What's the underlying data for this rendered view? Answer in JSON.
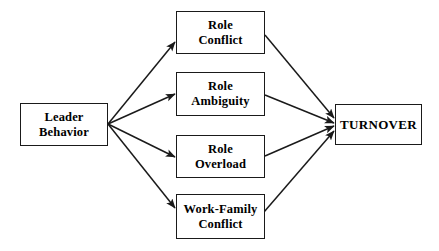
{
  "diagram": {
    "background_color": "#ffffff",
    "line_color": "#1a1a1a",
    "text_color": "#000000",
    "nodes": [
      {
        "id": "leader-behavior",
        "label": "Leader\nBehavior",
        "role": "predictor",
        "x": 20,
        "y": 103,
        "w": 88,
        "h": 43
      },
      {
        "id": "role-conflict",
        "label": "Role\nConflict",
        "role": "mediator",
        "x": 176,
        "y": 11,
        "w": 89,
        "h": 43
      },
      {
        "id": "role-ambiguity",
        "label": "Role\nAmbiguity",
        "role": "mediator",
        "x": 176,
        "y": 72,
        "w": 89,
        "h": 44
      },
      {
        "id": "role-overload",
        "label": "Role\nOverload",
        "role": "mediator",
        "x": 176,
        "y": 135,
        "w": 89,
        "h": 43
      },
      {
        "id": "work-family-conflict",
        "label": "Work-Family\nConflict",
        "role": "mediator",
        "x": 176,
        "y": 194,
        "w": 89,
        "h": 45
      },
      {
        "id": "turnover",
        "label": "TURNOVER",
        "role": "outcome",
        "x": 335,
        "y": 104,
        "w": 87,
        "h": 41
      }
    ],
    "edges": [
      {
        "id": "leader-to-role-conflict",
        "from": "leader-behavior",
        "to": "role-conflict",
        "x1": 108,
        "y1": 124,
        "x2": 175,
        "y2": 42
      },
      {
        "id": "leader-to-role-ambiguity",
        "from": "leader-behavior",
        "to": "role-ambiguity",
        "x1": 108,
        "y1": 124,
        "x2": 175,
        "y2": 94
      },
      {
        "id": "leader-to-role-overload",
        "from": "leader-behavior",
        "to": "role-overload",
        "x1": 108,
        "y1": 124,
        "x2": 175,
        "y2": 157
      },
      {
        "id": "leader-to-work-family-conflict",
        "from": "leader-behavior",
        "to": "work-family-conflict",
        "x1": 108,
        "y1": 124,
        "x2": 175,
        "y2": 208
      },
      {
        "id": "role-conflict-to-turnover",
        "from": "role-conflict",
        "to": "turnover",
        "x1": 265,
        "y1": 35,
        "x2": 334,
        "y2": 118
      },
      {
        "id": "role-ambiguity-to-turnover",
        "from": "role-ambiguity",
        "to": "turnover",
        "x1": 265,
        "y1": 95,
        "x2": 334,
        "y2": 123
      },
      {
        "id": "role-overload-to-turnover",
        "from": "role-overload",
        "to": "turnover",
        "x1": 265,
        "y1": 156,
        "x2": 334,
        "y2": 126
      },
      {
        "id": "work-family-conflict-to-turnover",
        "from": "work-family-conflict",
        "to": "turnover",
        "x1": 264,
        "y1": 212,
        "x2": 334,
        "y2": 131
      }
    ]
  }
}
